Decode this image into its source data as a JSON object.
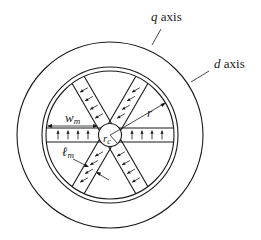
{
  "figure": {
    "type": "interior permanent magnet rotor cross-section",
    "labels": {
      "q_axis": {
        "symbol": "q",
        "text": " axis"
      },
      "d_axis": {
        "symbol": "d",
        "text": " axis"
      },
      "magnet_width": {
        "symbol": "w",
        "subscript": "m"
      },
      "magnet_length": {
        "symbol": "ℓ",
        "subscript": "m"
      },
      "rotor_radius": {
        "symbol": "r"
      },
      "core_radius": {
        "symbol": "r",
        "subscript": "c"
      }
    },
    "magnets": {
      "count": 6,
      "spoke_angles_deg": [
        0,
        60,
        120,
        180,
        240,
        300
      ],
      "arrows_per_magnet": 4,
      "arrow_direction": "up-perpendicular"
    },
    "colors": {
      "ink": "#1a1a1a",
      "background": "#ffffff"
    }
  }
}
